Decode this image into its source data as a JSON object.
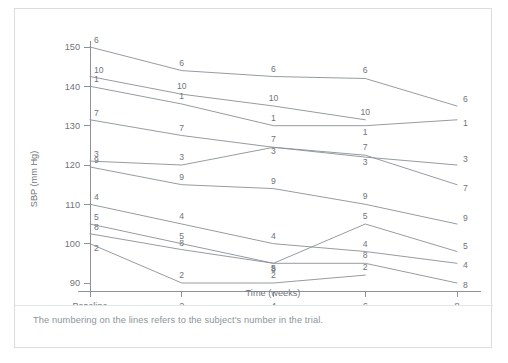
{
  "figure": {
    "caption": "The numbering on the lines refers to the subject's number in the trial.",
    "line_color": "#8a9095",
    "text_color": "#6f7479",
    "border_color": "#d9dde0"
  },
  "chart_data": {
    "type": "line",
    "title": "",
    "xlabel": "Time (weeks)",
    "ylabel": "SBP (mm Hg)",
    "x": [
      0,
      2,
      4,
      6,
      8
    ],
    "categories": [
      "Baseline",
      "2",
      "4",
      "6",
      "8"
    ],
    "xticklabels": [
      "Baseline",
      "2",
      "4",
      "6",
      "8"
    ],
    "yticks": [
      90,
      100,
      110,
      120,
      130,
      140,
      150
    ],
    "yticklabels": [
      "90",
      "100",
      "110",
      "120",
      "130",
      "140",
      "150"
    ],
    "ylim": [
      87,
      152
    ],
    "xlim": [
      -0.35,
      8.35
    ],
    "grid": false,
    "legend": "none",
    "point_labels_inline": true,
    "series": [
      {
        "name": "6",
        "label": "6",
        "values": [
          150,
          144,
          142.5,
          142,
          135
        ]
      },
      {
        "name": "10",
        "label": "10",
        "values": [
          142.5,
          138,
          135,
          131.5,
          null
        ]
      },
      {
        "name": "1",
        "label": "1",
        "values": [
          140,
          135.5,
          130,
          130,
          131.5
        ]
      },
      {
        "name": "7",
        "label": "7",
        "values": [
          131.5,
          127.5,
          124.5,
          122.5,
          115
        ]
      },
      {
        "name": "3",
        "label": "3",
        "values": [
          121,
          120,
          124.5,
          122,
          120
        ]
      },
      {
        "name": "9",
        "label": "9",
        "values": [
          119.5,
          115,
          114,
          110,
          105
        ]
      },
      {
        "name": "4",
        "label": "4",
        "values": [
          110,
          105,
          100,
          98,
          95
        ]
      },
      {
        "name": "5",
        "label": "5",
        "values": [
          105,
          100,
          95,
          105,
          98
        ]
      },
      {
        "name": "8",
        "label": "8",
        "values": [
          102.5,
          98.5,
          95,
          95,
          90
        ]
      },
      {
        "name": "2",
        "label": "2",
        "values": [
          100,
          90,
          90,
          92,
          null
        ]
      }
    ]
  }
}
